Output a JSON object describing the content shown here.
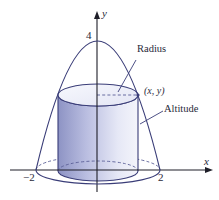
{
  "figure": {
    "axes": {
      "x_label": "x",
      "y_label": "y",
      "x_ticks": [
        "−2",
        "2"
      ],
      "y_ticks": [
        "4"
      ]
    },
    "labels": {
      "radius": "Radius",
      "altitude": "Altitude",
      "point": "(x, y)"
    },
    "colors": {
      "outline": "#3a3d78",
      "cylinder_dark": "#8d93c4",
      "cylinder_light": "#eef0fa",
      "axis": "#1e1e28"
    }
  }
}
